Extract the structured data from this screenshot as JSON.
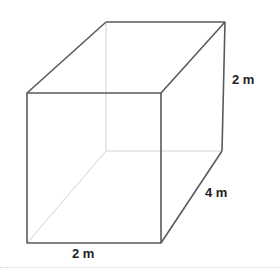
{
  "figure": {
    "type": "rectangular-prism",
    "colors": {
      "edge": "#555555",
      "hidden_edge": "#d0d0d0",
      "label": "#222222"
    },
    "vertices": {
      "front_top_left": [
        27,
        93
      ],
      "front_top_right": [
        161,
        93
      ],
      "front_bottom_left": [
        27,
        243
      ],
      "front_bottom_right": [
        161,
        243
      ],
      "back_top_left": [
        106,
        22
      ],
      "back_top_right": [
        225,
        22
      ],
      "back_bottom_left": [
        106,
        151
      ],
      "back_bottom_right": [
        222,
        151
      ]
    },
    "labels": {
      "height": "2 m",
      "depth": "4 m",
      "width": "2 m"
    }
  }
}
